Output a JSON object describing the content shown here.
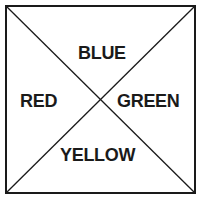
{
  "diagram": {
    "type": "square-with-diagonals",
    "stroke_color": "#1a1a1a",
    "background": "#ffffff",
    "quadrants": {
      "top": {
        "label": "BLUE"
      },
      "left": {
        "label": "RED"
      },
      "right": {
        "label": "GREEN"
      },
      "bottom": {
        "label": "YELLOW"
      }
    }
  }
}
